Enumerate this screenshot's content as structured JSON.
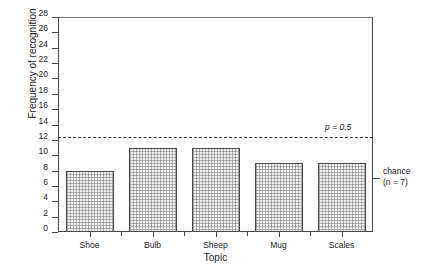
{
  "chart_data": {
    "type": "bar",
    "title": "",
    "subtitle": "",
    "xlabel": "Topic",
    "ylabel": "Frequency of recognition",
    "categories": [
      "Shoe",
      "Bulb",
      "Sheep",
      "Mug",
      "Scales"
    ],
    "values": [
      8,
      11,
      11,
      9,
      9
    ],
    "ylim": [
      0,
      28
    ],
    "ytick_labels": [
      "0",
      "2",
      "4",
      "6",
      "8",
      "10",
      "12",
      "14",
      "16",
      "18",
      "20",
      "22",
      "24",
      "26",
      "28"
    ],
    "ytick_values": [
      0,
      2,
      4,
      6,
      8,
      10,
      12,
      14,
      16,
      18,
      20,
      22,
      24,
      26,
      28
    ],
    "grid": false,
    "legend": "none",
    "annotations": [
      {
        "name": "significance-threshold",
        "label": "p = 0.5",
        "value": 12.4,
        "style": "dashed-horizontal-line"
      },
      {
        "name": "chance-level",
        "label_line1": "chance",
        "label_line2": "(n = 7)",
        "value": 7,
        "style": "right-axis-tick"
      }
    ],
    "bar_fill": "#f2f2f2",
    "bar_edge": "#4a4a4a",
    "axis_color": "#444444"
  }
}
